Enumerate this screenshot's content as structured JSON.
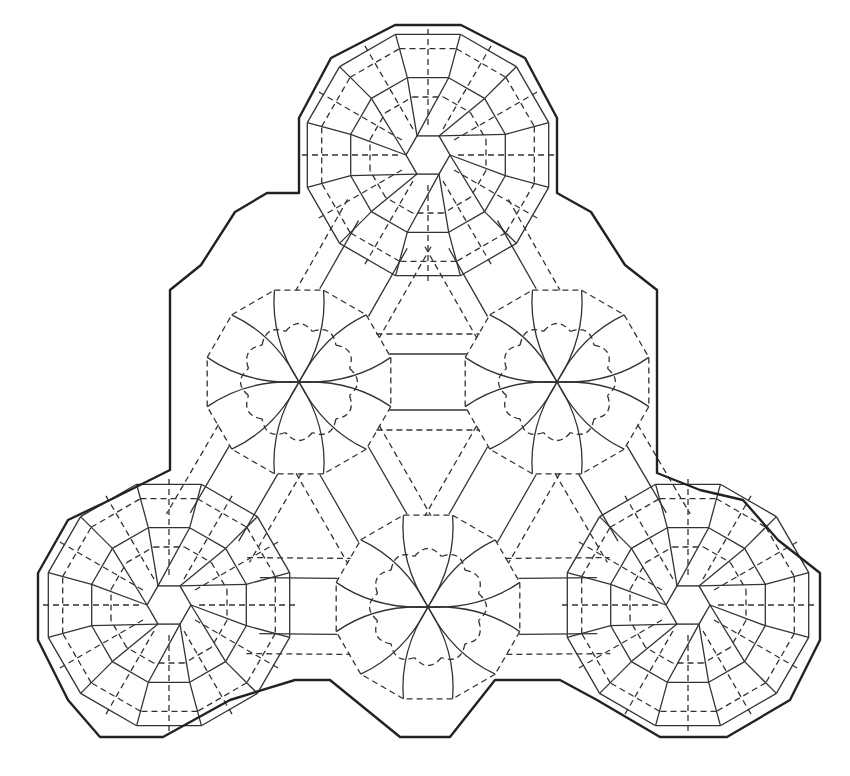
{
  "diagram": {
    "type": "origami-crease-pattern",
    "colors": {
      "background": "#ffffff",
      "mountain": "#333333",
      "valley": "#333333",
      "border": "#222222"
    },
    "line_styles": {
      "mountain": "solid",
      "valley": "dashed",
      "border": "thick-solid"
    },
    "hex_hubs": [
      {
        "name": "top",
        "cx": 428,
        "cy": 155
      },
      {
        "name": "bottom-left",
        "cx": 169,
        "cy": 605
      },
      {
        "name": "bottom-right",
        "cx": 688,
        "cy": 605
      }
    ],
    "star_hubs": [
      {
        "name": "mid-left",
        "cx": 299,
        "cy": 382
      },
      {
        "name": "mid-right",
        "cx": 557,
        "cy": 382
      },
      {
        "name": "bottom-center",
        "cx": 428,
        "cy": 607
      }
    ],
    "outline": [
      [
        395,
        25
      ],
      [
        461,
        25
      ],
      [
        525,
        58
      ],
      [
        557,
        118
      ],
      [
        557,
        193
      ],
      [
        591,
        212
      ],
      [
        625,
        265
      ],
      [
        657,
        290
      ],
      [
        657,
        473
      ],
      [
        700,
        490
      ],
      [
        743,
        500
      ],
      [
        778,
        540
      ],
      [
        820,
        573
      ],
      [
        820,
        640
      ],
      [
        790,
        700
      ],
      [
        727,
        737
      ],
      [
        660,
        737
      ],
      [
        597,
        700
      ],
      [
        560,
        680
      ],
      [
        495,
        680
      ],
      [
        450,
        737
      ],
      [
        400,
        737
      ],
      [
        330,
        680
      ],
      [
        295,
        680
      ],
      [
        230,
        700
      ],
      [
        163,
        737
      ],
      [
        100,
        737
      ],
      [
        68,
        700
      ],
      [
        38,
        640
      ],
      [
        38,
        573
      ],
      [
        68,
        520
      ],
      [
        110,
        500
      ],
      [
        170,
        470
      ],
      [
        170,
        290
      ],
      [
        201,
        265
      ],
      [
        235,
        212
      ],
      [
        267,
        193
      ],
      [
        299,
        193
      ],
      [
        299,
        118
      ],
      [
        331,
        58
      ]
    ]
  }
}
